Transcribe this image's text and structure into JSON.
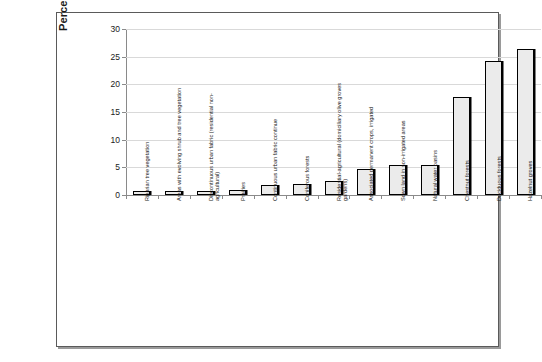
{
  "chart_data": {
    "type": "bar",
    "title": "",
    "xlabel": "",
    "ylabel": "Percentages of surface area occupied",
    "ylim": [
      0,
      30
    ],
    "ytick_labels": [
      "0",
      "5",
      "10",
      "15",
      "20",
      "25",
      "30"
    ],
    "ytick_values": [
      0,
      5,
      10,
      15,
      20,
      25,
      30
    ],
    "grid": true,
    "legend": "none",
    "bar_fill_color": "#ebebeb",
    "bar_edge_color": "#000000",
    "gridline_color": "#d9d9d9",
    "axis_color": "#8a8a8a",
    "categories": [
      "Riparian tree vegetation",
      "Areas with evolving shrub and tree vegetation",
      "Discontinuous urban fabric (residential non-agricultural)",
      "Prairies",
      "Continuous urban fabric continue",
      "Coniferous forests",
      "Residential-agricultural (domiciliary olive groves gardens)",
      "Associated permanent crops, irrigated",
      "Sown land in non-irrigated areas",
      "Natural water basins",
      "Chestnut forests",
      "Deciduous forests",
      "Hazelnut groves"
    ],
    "values": [
      0.8,
      0.8,
      0.8,
      0.9,
      1.8,
      2.0,
      2.5,
      4.7,
      5.5,
      5.5,
      17.8,
      24.2,
      26.4
    ]
  }
}
